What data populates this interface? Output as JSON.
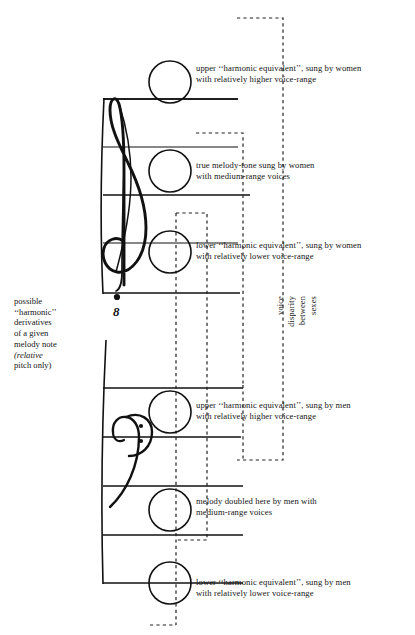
{
  "figure": {
    "left_caption": {
      "line1": "possible",
      "line2": "‘‘harmonic’’",
      "line3": "derivatives",
      "line4": "of a given",
      "line5": "melody note",
      "line6_italic": "(relative",
      "line7": "pitch only)"
    },
    "vertical_label": {
      "line1": "voice",
      "line2": "disparity",
      "line3": "between",
      "line4": "sexes"
    },
    "octave_marker": "8",
    "clefs": {
      "upper": "treble-clef-octave-down",
      "lower": "bass-clef"
    },
    "annotations": [
      {
        "id": "upper-harmonic-women",
        "line1": "upper ‘‘harmonic equivalent’’, sung by women",
        "line2": "with relatively higher voice-range"
      },
      {
        "id": "true-melody-women",
        "line1": "true melody-tone sung by women",
        "line2": "with medium-range voices"
      },
      {
        "id": "lower-harmonic-women",
        "line1": "lower ‘‘harmonic equivalent’’, sung by women",
        "line2": "with relatively lower voice-range"
      },
      {
        "id": "upper-harmonic-men",
        "line1": "upper ‘‘harmonic equivalent’’, sung by men",
        "line2": "with relatively higher voice-range"
      },
      {
        "id": "melody-doubled-men",
        "line1": "melody doubled here by men with",
        "line2": "medium-range voices"
      },
      {
        "id": "lower-harmonic-men",
        "line1": "lower ‘‘harmonic equivalent’’, sung by men",
        "line2": "with relatively lower voice-range"
      }
    ],
    "colors": {
      "ink": "#111111",
      "paper": "#ffffff",
      "dashed": "#222222"
    }
  }
}
